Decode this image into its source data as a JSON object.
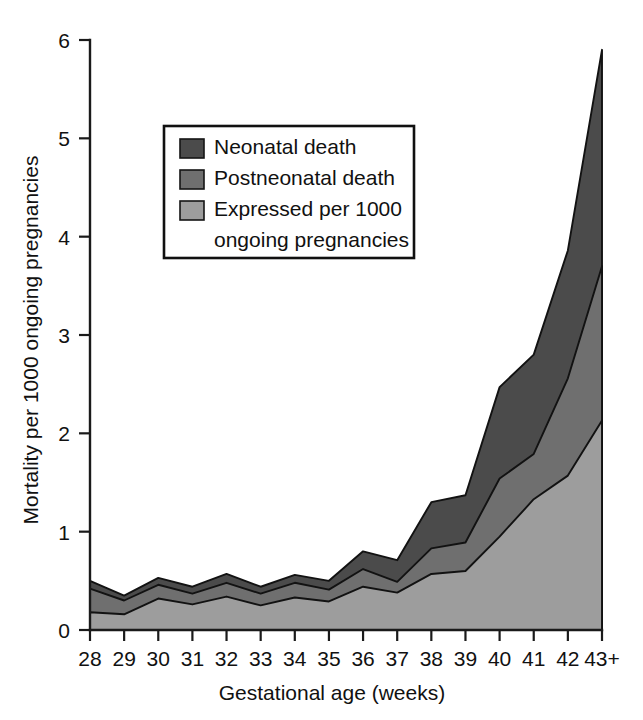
{
  "chart_data": {
    "type": "area",
    "title": "",
    "subtitle": "",
    "stacked": true,
    "xlabel": "Gestational age (weeks)",
    "ylabel": "Mortality per 1000 ongoing pregnancies",
    "categories": [
      "28",
      "29",
      "30",
      "31",
      "32",
      "33",
      "34",
      "35",
      "36",
      "37",
      "38",
      "39",
      "40",
      "41",
      "42",
      "43+"
    ],
    "xtick_labels": [
      "28",
      "29",
      "30",
      "31",
      "32",
      "33",
      "34",
      "35",
      "36",
      "37",
      "38",
      "39",
      "40",
      "41",
      "42",
      "43+"
    ],
    "ytick_labels": [
      "0",
      "1",
      "2",
      "3",
      "4",
      "5",
      "6"
    ],
    "ytick_values": [
      0,
      1,
      2,
      3,
      4,
      5,
      6
    ],
    "ylim": [
      0,
      6
    ],
    "grid": false,
    "legend_position": "upper-left-inside",
    "series": [
      {
        "name": "Expressed per 1000 ongoing pregnancies",
        "color": "#9d9d9d",
        "order": 1,
        "values": [
          0.18,
          0.16,
          0.32,
          0.26,
          0.34,
          0.25,
          0.33,
          0.29,
          0.44,
          0.38,
          0.57,
          0.6,
          0.95,
          1.33,
          1.57,
          2.13
        ]
      },
      {
        "name": "Postneonatal death",
        "color": "#6f6f6f",
        "order": 2,
        "values": [
          0.24,
          0.14,
          0.14,
          0.11,
          0.14,
          0.12,
          0.15,
          0.12,
          0.18,
          0.11,
          0.26,
          0.29,
          0.59,
          0.46,
          0.99,
          1.57
        ]
      },
      {
        "name": "Neonatal death",
        "color": "#4b4b4b",
        "order": 3,
        "values": [
          0.08,
          0.05,
          0.07,
          0.07,
          0.09,
          0.07,
          0.08,
          0.09,
          0.18,
          0.22,
          0.47,
          0.48,
          0.93,
          1.01,
          1.3,
          2.2
        ]
      }
    ],
    "cumulative_top": [
      0.5,
      0.35,
      0.53,
      0.44,
      0.57,
      0.44,
      0.56,
      0.5,
      0.8,
      0.71,
      1.3,
      1.37,
      2.47,
      2.8,
      3.86,
      5.9
    ],
    "cumulative_mid": [
      0.42,
      0.3,
      0.46,
      0.37,
      0.48,
      0.37,
      0.48,
      0.41,
      0.62,
      0.49,
      0.83,
      0.89,
      1.54,
      1.79,
      2.56,
      3.7
    ],
    "cumulative_low": [
      0.18,
      0.16,
      0.32,
      0.26,
      0.34,
      0.25,
      0.33,
      0.29,
      0.44,
      0.38,
      0.57,
      0.6,
      0.95,
      1.33,
      1.57,
      2.13
    ]
  },
  "legend": {
    "items": [
      {
        "label": "Neonatal death",
        "color": "#4b4b4b"
      },
      {
        "label": "Postneonatal death",
        "color": "#6f6f6f"
      },
      {
        "label": "Expressed per 1000",
        "color": "#9d9d9d"
      },
      {
        "label": "ongoing pregnancies",
        "color": ""
      }
    ]
  },
  "axes": {
    "y_title": "Mortality per 1000 ongoing pregnancies",
    "x_title": "Gestational age (weeks)",
    "y_ticks": [
      "0",
      "1",
      "2",
      "3",
      "4",
      "5",
      "6"
    ],
    "x_ticks": [
      "28",
      "29",
      "30",
      "31",
      "32",
      "33",
      "34",
      "35",
      "36",
      "37",
      "38",
      "39",
      "40",
      "41",
      "42",
      "43+"
    ]
  }
}
